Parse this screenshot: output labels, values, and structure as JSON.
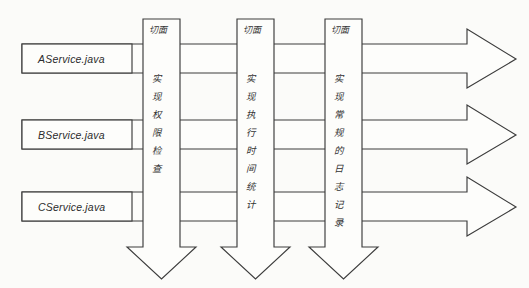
{
  "diagram": {
    "background_color": "#fbfbf9",
    "line_color": "#3c3c3c",
    "fill_color": "#fdfdfb",
    "services": [
      {
        "label": "AService.java"
      },
      {
        "label": "BService.java"
      },
      {
        "label": "CService.java"
      }
    ],
    "aspects": [
      {
        "title": "切面",
        "description": "实现权限检查",
        "chars": [
          "实",
          "现",
          "权",
          "限",
          "检",
          "查"
        ]
      },
      {
        "title": "切面",
        "description": "实现执行时间统计",
        "chars": [
          "实",
          "现",
          "执",
          "行",
          "时",
          "间",
          "统",
          "计"
        ]
      },
      {
        "title": "切面",
        "description": "实现常规的日志记录",
        "chars": [
          "实",
          "现",
          "常",
          "规",
          "的",
          "日",
          "志",
          "记",
          "录"
        ]
      }
    ],
    "flow_arrows": [
      {
        "direction": "right",
        "row": 1
      },
      {
        "direction": "right",
        "row": 2
      },
      {
        "direction": "right",
        "row": 3
      }
    ],
    "aspect_arrows": [
      {
        "direction": "down",
        "column": 1
      },
      {
        "direction": "down",
        "column": 2
      },
      {
        "direction": "down",
        "column": 3
      }
    ]
  }
}
